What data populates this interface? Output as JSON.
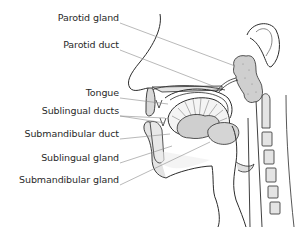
{
  "diagram": {
    "labels": [
      {
        "id": "parotid-gland",
        "text": "Parotid gland",
        "x": 119,
        "y": 17
      },
      {
        "id": "parotid-duct",
        "text": "Parotid duct",
        "x": 119,
        "y": 44
      },
      {
        "id": "tongue",
        "text": "Tongue",
        "x": 119,
        "y": 92
      },
      {
        "id": "sublingual-ducts",
        "text": "Sublingual ducts",
        "x": 119,
        "y": 110
      },
      {
        "id": "submandibular-duct",
        "text": "Submandibular duct",
        "x": 119,
        "y": 133
      },
      {
        "id": "sublingual-gland",
        "text": "Sublingual gland",
        "x": 119,
        "y": 157
      },
      {
        "id": "submandibular-gland",
        "text": "Submandibular gland",
        "x": 119,
        "y": 179
      }
    ],
    "colors": {
      "outline": "#2b2b2b",
      "leader": "#8a8a8a",
      "gland_fill": "#cfcfcf",
      "tissue_fill": "#e4e4e4",
      "background": "#ffffff"
    }
  }
}
